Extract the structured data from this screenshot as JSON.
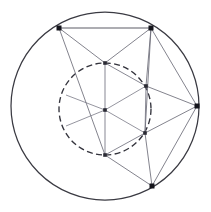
{
  "figure": {
    "canvas": {
      "width": 211,
      "height": 212,
      "background": "#ffffff"
    },
    "colors": {
      "outer_circle_stroke": "#3a3a42",
      "inner_circle_stroke": "#33333c",
      "chord_stroke": "#6d6d78",
      "spoke_stroke": "#7a7a86",
      "vertex_fill": "#15151c"
    },
    "outer_circle": {
      "cx": 105,
      "cy": 106,
      "r": 94,
      "style": "solid"
    },
    "inner_circle": {
      "cx": 105,
      "cy": 109,
      "r": 46,
      "style": "dashed"
    },
    "center_point": {
      "label": "O",
      "x": 105,
      "y": 110
    },
    "outer_vertices": [
      {
        "label": "A",
        "x": 59,
        "y": 28
      },
      {
        "label": "B",
        "x": 151,
        "y": 28
      },
      {
        "label": "C",
        "x": 197,
        "y": 106
      },
      {
        "label": "D",
        "x": 152,
        "y": 186
      }
    ],
    "inner_vertices": [
      {
        "label": "P1",
        "x": 105,
        "y": 63
      },
      {
        "label": "P2",
        "x": 146,
        "y": 86
      },
      {
        "label": "P3",
        "x": 145,
        "y": 133
      },
      {
        "label": "P4",
        "x": 105,
        "y": 155
      }
    ],
    "edges": [
      {
        "from": "A",
        "to": "B",
        "kind": "chord"
      },
      {
        "from": "A",
        "to": "P1",
        "kind": "chord"
      },
      {
        "from": "B",
        "to": "P1",
        "kind": "chord"
      },
      {
        "from": "A",
        "to": "P4",
        "kind": "chord"
      },
      {
        "from": "B",
        "to": "P2",
        "kind": "chord"
      },
      {
        "from": "B",
        "to": "P3",
        "kind": "chord"
      },
      {
        "from": "B",
        "to": "C",
        "kind": "chord"
      },
      {
        "from": "C",
        "to": "P2",
        "kind": "chord"
      },
      {
        "from": "C",
        "to": "P3",
        "kind": "chord"
      },
      {
        "from": "C",
        "to": "D",
        "kind": "chord"
      },
      {
        "from": "D",
        "to": "P3",
        "kind": "chord"
      },
      {
        "from": "D",
        "to": "P4",
        "kind": "chord"
      },
      {
        "from": "P1",
        "to": "P4",
        "kind": "hex-edge"
      },
      {
        "from": "P2",
        "to": "P3",
        "kind": "hex-edge"
      },
      {
        "from": "P1",
        "to": "P2",
        "kind": "hex-edge"
      },
      {
        "from": "P3",
        "to": "P4",
        "kind": "hex-edge"
      }
    ],
    "spokes": [
      {
        "from": "O",
        "to": "P1"
      },
      {
        "from": "O",
        "to": "P2"
      },
      {
        "from": "O",
        "to": "P3"
      },
      {
        "from": "O",
        "to": "P4"
      },
      {
        "from": "O",
        "to": "L1",
        "x2": 66,
        "y2": 95
      },
      {
        "from": "O",
        "to": "L2",
        "x2": 66,
        "y2": 126
      }
    ],
    "counts": {
      "outer_vertex_dots": 4,
      "inner_node_dots": 4,
      "circles": 2
    }
  }
}
